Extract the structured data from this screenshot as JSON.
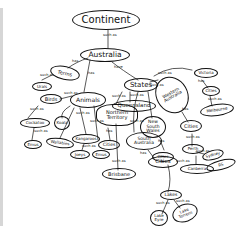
{
  "diagram": {
    "type": "concept-map",
    "style": "hand-drawn",
    "nodes": {
      "continent": "Continent",
      "australia": "Australia",
      "terms": "Terms",
      "animals": "Animals",
      "states": "States",
      "urals": "Urals",
      "birds": "Birds",
      "cockatoo": "Cockatoo",
      "koala": "Koala",
      "emus": "Emus",
      "wallabies": "Wallabies",
      "kangaroos": "Kangaroos",
      "joeys": "Joeys",
      "emus2": "Emus",
      "queensland": "Queensland",
      "northern_territory": "Northern Territory",
      "nt_cities": "Cities",
      "brisbane": "Brisbane",
      "new_south_wales": "New South Wales",
      "south_australia": "South Australia",
      "sa_cities": "Cities",
      "lakes": "Lakes",
      "lake_eyre": "Lake Eyre",
      "lake_torrens": "Lake Torrens",
      "western_australia": "Western Australia",
      "victoria": "Victoria",
      "vic_cities": "Cities",
      "melbourne": "Melbourne",
      "wa_cities": "Cities",
      "perth": "Perth",
      "sydney": "Sydney",
      "canberra": "Canberra",
      "cities_small": "Cities",
      "rs": "RS"
    },
    "link_labels": {
      "continent_australia": "such as",
      "australia_terms": "has",
      "australia_animals": "has",
      "australia_states": "have",
      "terms_urals": "such as",
      "animals_birds": "such as",
      "birds_cockatoo": "such as",
      "animals_koala": "such as",
      "animals_kangaroos": "such as",
      "animals_wallabies": "such as",
      "kangaroos_joeys": "such as",
      "cockatoo_emus": "such as",
      "states_queensland": "such as",
      "states_nt": "such as",
      "states_wa": "such as",
      "states_nsw": "such as",
      "states_sa": "such as",
      "states_victoria": "such as",
      "nt_cities": "has",
      "queensland_brisbane": "such as",
      "sa_cities": "has",
      "sa_lakes": "has",
      "lakes_eyre": "such as",
      "lakes_torrens": "such as",
      "victoria_cities": "has",
      "cities_melbourne": "such as",
      "wa_cities": "has",
      "cities_perth": "such as",
      "nsw_cities": "has",
      "cities_sydney": "such as",
      "cities_canberra": "such as"
    }
  }
}
